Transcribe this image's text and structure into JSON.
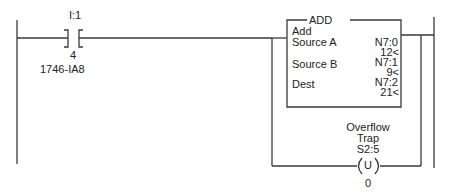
{
  "contact": {
    "address": "I:1",
    "bit": "4",
    "module": "1746-IA8",
    "type": "XIC"
  },
  "instruction": {
    "mnemonic": "ADD",
    "name": "Add",
    "rows": [
      {
        "label": "Source A",
        "address": "N7:0",
        "value": "12<"
      },
      {
        "label": "Source B",
        "address": "N7:1",
        "value": "9<"
      },
      {
        "label": "Dest",
        "address": "N7:2",
        "value": "21<"
      }
    ]
  },
  "coil": {
    "desc_line1": "Overflow",
    "desc_line2": "Trap",
    "address": "S2:5",
    "symbol": "U",
    "bit": "0"
  },
  "colors": {
    "line": "#3a3a3a",
    "text": "#222222"
  }
}
